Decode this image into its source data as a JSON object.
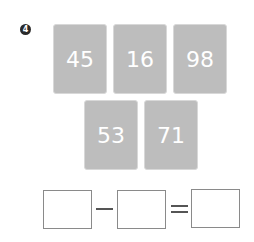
{
  "problem": {
    "number": "4",
    "cards": [
      {
        "value": "45"
      },
      {
        "value": "16"
      },
      {
        "value": "98"
      },
      {
        "value": "53"
      },
      {
        "value": "71"
      }
    ],
    "equation": {
      "operator": "minus",
      "result_operator": "equals",
      "boxes": [
        "",
        "",
        ""
      ]
    }
  }
}
